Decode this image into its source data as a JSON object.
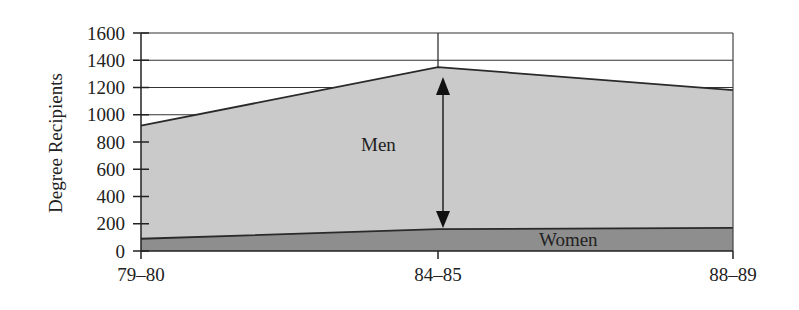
{
  "chart_data": {
    "type": "area",
    "title": "",
    "xlabel": "",
    "ylabel": "Degree Recipients",
    "categories": [
      "79–80",
      "84–85",
      "88–89"
    ],
    "series": [
      {
        "name": "Women",
        "values": [
          90,
          160,
          170
        ],
        "color": "#8c8c8c"
      },
      {
        "name": "Men",
        "values": [
          920,
          1350,
          1180
        ],
        "color": "#c8c8c8",
        "note": "stacked total (men + women)"
      }
    ],
    "ylim": [
      0,
      1600
    ],
    "yticks": [
      0,
      200,
      400,
      600,
      800,
      1000,
      1200,
      1400,
      1600
    ],
    "grid": true,
    "legend": "none",
    "annotations": [
      {
        "text": "Men",
        "type": "label"
      },
      {
        "text": "Women",
        "type": "label"
      },
      {
        "type": "double-arrow",
        "at": "84–85",
        "from": 160,
        "to": 1350
      }
    ]
  },
  "labels": {
    "ylabel": "Degree Recipients",
    "men": "Men",
    "women": "Women",
    "x": [
      "79–80",
      "84–85",
      "88–89"
    ],
    "y": [
      "0",
      "200",
      "400",
      "600",
      "800",
      "1000",
      "1200",
      "1400",
      "1600"
    ]
  }
}
